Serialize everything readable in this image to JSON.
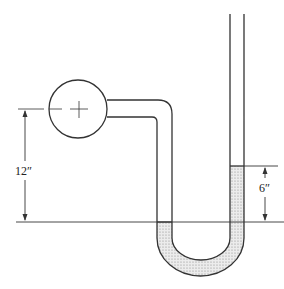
{
  "diagram": {
    "type": "u-tube manometer",
    "labels": {
      "bulb_height": "12″",
      "fluid_difference": "6″"
    },
    "colors": {
      "line": "#333333",
      "fluid": "#d8d8d8",
      "background": "#ffffff"
    }
  }
}
